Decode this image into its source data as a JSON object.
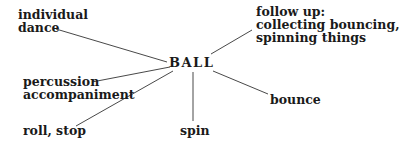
{
  "diagram": {
    "center": "BALL",
    "nodes": [
      {
        "id": "individual-dance",
        "lines": [
          "individual",
          "dance"
        ]
      },
      {
        "id": "follow-up",
        "lines": [
          "follow up:",
          "collecting bouncing,",
          "spinning things"
        ]
      },
      {
        "id": "percussion",
        "lines": [
          "percussion",
          "accompaniment"
        ]
      },
      {
        "id": "bounce",
        "lines": [
          "bounce"
        ]
      },
      {
        "id": "roll-stop",
        "lines": [
          "roll, stop"
        ]
      },
      {
        "id": "spin",
        "lines": [
          "spin"
        ]
      }
    ],
    "line_color": "#333333",
    "text_color": "#1a1a1a"
  }
}
